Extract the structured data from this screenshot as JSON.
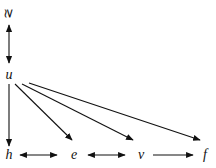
{
  "diagram": {
    "nodes": {
      "top": "≳",
      "u": "u",
      "h": "h",
      "e": "e",
      "v": "v",
      "f": "f"
    },
    "edges": [
      {
        "from": "top",
        "to": "u",
        "type": "bidirectional"
      },
      {
        "from": "u",
        "to": "h",
        "type": "directed"
      },
      {
        "from": "u",
        "to": "e",
        "type": "directed"
      },
      {
        "from": "u",
        "to": "v",
        "type": "directed"
      },
      {
        "from": "u",
        "to": "f",
        "type": "directed"
      },
      {
        "from": "h",
        "to": "e",
        "type": "bidirectional"
      },
      {
        "from": "e",
        "to": "v",
        "type": "bidirectional"
      },
      {
        "from": "v",
        "to": "f",
        "type": "directed"
      }
    ]
  }
}
